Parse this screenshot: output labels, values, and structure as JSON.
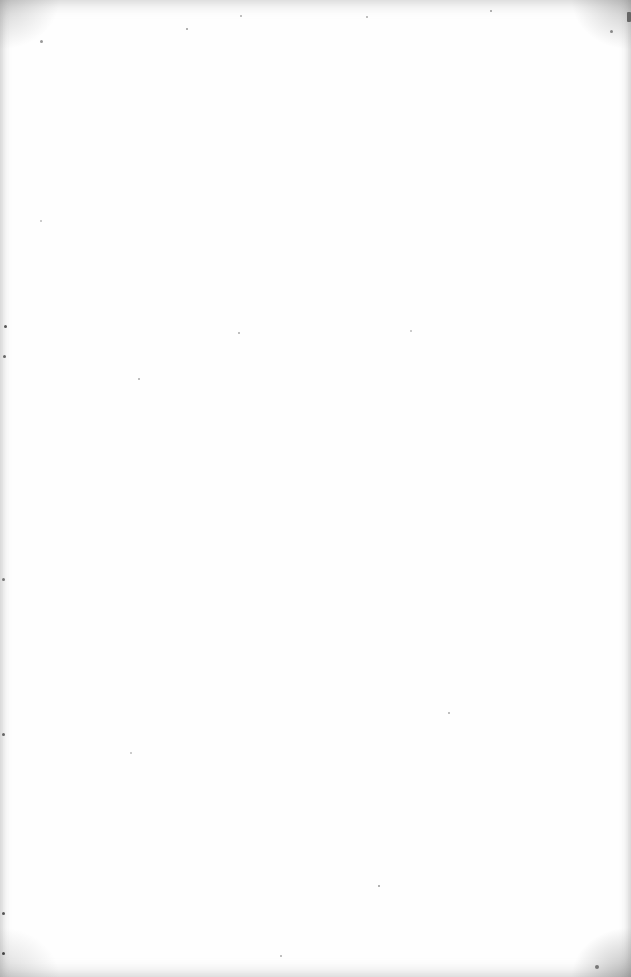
{
  "page": {
    "type": "blank-scanned-page",
    "background_color": "#fefefe",
    "noise_color": "#888888"
  }
}
